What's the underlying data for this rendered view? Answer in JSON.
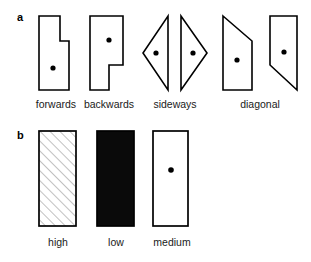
{
  "figure": {
    "panels": [
      {
        "id": "a",
        "label": "a",
        "kind": "movement-direction-icons",
        "items": [
          {
            "label": "forwards",
            "shape": "stepped-polygon-narrow-top",
            "marker": "dot",
            "marker_position": "lower-center"
          },
          {
            "label": "backwards",
            "shape": "stepped-polygon-wide-top",
            "marker": "dot",
            "marker_position": "upper-center"
          },
          {
            "label": "sideways",
            "shape": "triangle-pair-pointing-left-and-right",
            "marker": "dot",
            "marker_position": "mid-center"
          },
          {
            "label": "diagonal",
            "shape": "parallelogram-pair-sloped-top-and-bottom",
            "marker": "dot",
            "marker_position": "mid-center"
          }
        ]
      },
      {
        "id": "b",
        "label": "b",
        "kind": "density-level-swatches",
        "items": [
          {
            "label": "high",
            "fill": "diagonal-hatch",
            "marker": "none"
          },
          {
            "label": "low",
            "fill": "solid-black",
            "marker": "none"
          },
          {
            "label": "medium",
            "fill": "white",
            "marker": "dot"
          }
        ]
      }
    ]
  },
  "colors": {
    "background": "#ffffff",
    "stroke": "#000000",
    "fill_white": "#ffffff",
    "fill_black": "#0a0a0a",
    "hatch_line": "#888888",
    "text": "#1a1a1a"
  }
}
